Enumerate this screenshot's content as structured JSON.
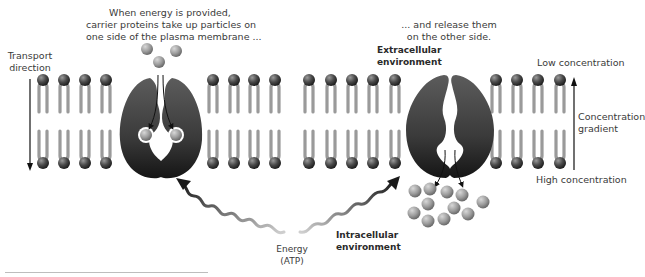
{
  "captions": {
    "top_left_line1": "When energy is provided,",
    "top_left_line2": "carrier proteins take up particles on",
    "top_left_line3": "one side of the plasma membrane ...",
    "top_right_line1": "... and release them",
    "top_right_line2": "on the other side."
  },
  "labels": {
    "transport_direction_line1": "Transport",
    "transport_direction_line2": "direction",
    "extracellular_line1": "Extracellular",
    "extracellular_line2": "environment",
    "intracellular_line1": "Intracellular",
    "intracellular_line2": "environment",
    "energy_line1": "Energy",
    "energy_line2": "(ATP)",
    "low_concentration": "Low concentration",
    "high_concentration": "High concentration",
    "gradient_line1": "Concentration",
    "gradient_line2": "gradient"
  },
  "membrane": {
    "lipid_x_positions": [
      43,
      64,
      85,
      106,
      213,
      234,
      254,
      275,
      309,
      331,
      352,
      373,
      395,
      496,
      517,
      538,
      560
    ],
    "top_head_y": 80,
    "bottom_head_y": 163
  },
  "colors": {
    "lipid_head": "#4a4a4a",
    "lipid_tail": "#9a9a9a",
    "protein": "#3a3a3a",
    "particle": "#9c9c9c",
    "text": "#3a3a3a"
  }
}
